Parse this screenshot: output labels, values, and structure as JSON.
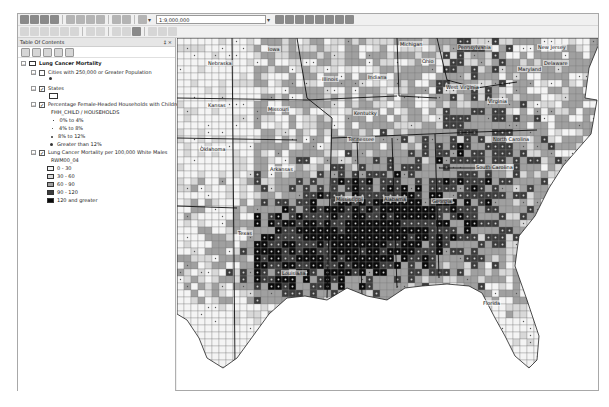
{
  "toolbar": {
    "row1_icons": [
      "new-document-icon",
      "open-icon",
      "save-icon",
      "print-icon",
      "cut-icon",
      "copy-icon",
      "paste-icon",
      "delete-icon",
      "undo-icon",
      "redo-icon",
      "add-data-icon"
    ],
    "scale_value": "1:9,000,000",
    "row1_right_icons": [
      "editor-toolbar-icon",
      "toc-window-icon",
      "catalog-window-icon",
      "search-window-icon",
      "arctoolbox-icon",
      "python-window-icon",
      "model-builder-icon",
      "whats-this-icon"
    ],
    "row2_icons": [
      "zoom-in-icon",
      "zoom-out-icon",
      "pan-icon",
      "full-extent-icon",
      "fixed-zoom-in-icon",
      "fixed-zoom-out-icon",
      "back-extent-icon",
      "forward-extent-icon",
      "select-features-icon",
      "clear-selection-icon",
      "select-elements-icon",
      "identify-icon",
      "find-icon",
      "measure-icon"
    ]
  },
  "toc": {
    "title": "Table Of Contents",
    "pin": "‡",
    "close": "×",
    "tool_icons": [
      "list-by-drawing-order-icon",
      "list-by-source-icon",
      "list-by-visibility-icon",
      "list-by-selection-icon",
      "options-icon"
    ],
    "group_name": "Lung Cancer Mortality",
    "layers": [
      {
        "name": "Cities with 250,000 or Greater Population",
        "checked": false,
        "legend": [
          {
            "symbol": "dot",
            "label": ""
          }
        ]
      },
      {
        "name": "States",
        "checked": true,
        "legend": [
          {
            "symbol": "hollow-box",
            "label": ""
          }
        ]
      },
      {
        "name": "Percentage Female-Headed Households with Children",
        "checked": true,
        "field": "FHH_CHILD / HOUSEHOLDS",
        "legend": [
          {
            "symbol": "dot-xs",
            "label": "0% to 4%"
          },
          {
            "symbol": "dot-s",
            "label": "4% to 8%"
          },
          {
            "symbol": "dot-m",
            "label": "8% to 12%"
          },
          {
            "symbol": "dot-l",
            "label": "Greater than 12%"
          }
        ]
      },
      {
        "name": "Lung Cancer Mortality per 100,000 White Males",
        "checked": true,
        "field": "RWM00_04",
        "legend": [
          {
            "color": "#f4f4f4",
            "label": "0 - 30"
          },
          {
            "color": "#d8d8d8",
            "label": "30 - 60"
          },
          {
            "color": "#a0a0a0",
            "label": "60 - 90"
          },
          {
            "color": "#3c3c3c",
            "label": "90 - 120"
          },
          {
            "color": "#0a0a0a",
            "label": "120 and greater"
          }
        ]
      }
    ]
  },
  "map": {
    "state_labels": [
      {
        "name": "Nebraska",
        "x": 30,
        "y": 22
      },
      {
        "name": "Iowa",
        "x": 90,
        "y": 8
      },
      {
        "name": "Michigan",
        "x": 222,
        "y": 3
      },
      {
        "name": "Pennsylvania",
        "x": 280,
        "y": 6
      },
      {
        "name": "New Jersey",
        "x": 360,
        "y": 6
      },
      {
        "name": "Ohio",
        "x": 244,
        "y": 20
      },
      {
        "name": "Illinois",
        "x": 144,
        "y": 38
      },
      {
        "name": "Indiana",
        "x": 190,
        "y": 36
      },
      {
        "name": "Maryland",
        "x": 340,
        "y": 28
      },
      {
        "name": "Delaware",
        "x": 366,
        "y": 22
      },
      {
        "name": "Kansas",
        "x": 30,
        "y": 64
      },
      {
        "name": "Missouri",
        "x": 90,
        "y": 68
      },
      {
        "name": "West Virginia",
        "x": 268,
        "y": 46
      },
      {
        "name": "Kentucky",
        "x": 176,
        "y": 72
      },
      {
        "name": "Virginia",
        "x": 310,
        "y": 60
      },
      {
        "name": "Oklahoma",
        "x": 22,
        "y": 108
      },
      {
        "name": "Tennessee",
        "x": 170,
        "y": 98
      },
      {
        "name": "North Carolina",
        "x": 315,
        "y": 98
      },
      {
        "name": "Arkansas",
        "x": 92,
        "y": 128
      },
      {
        "name": "South Carolina",
        "x": 298,
        "y": 126
      },
      {
        "name": "Mississippi",
        "x": 158,
        "y": 158
      },
      {
        "name": "Alabama",
        "x": 206,
        "y": 158
      },
      {
        "name": "Georgia",
        "x": 254,
        "y": 160
      },
      {
        "name": "Texas",
        "x": 60,
        "y": 192
      },
      {
        "name": "Louisiana",
        "x": 104,
        "y": 232
      },
      {
        "name": "Florida",
        "x": 305,
        "y": 262
      }
    ]
  }
}
